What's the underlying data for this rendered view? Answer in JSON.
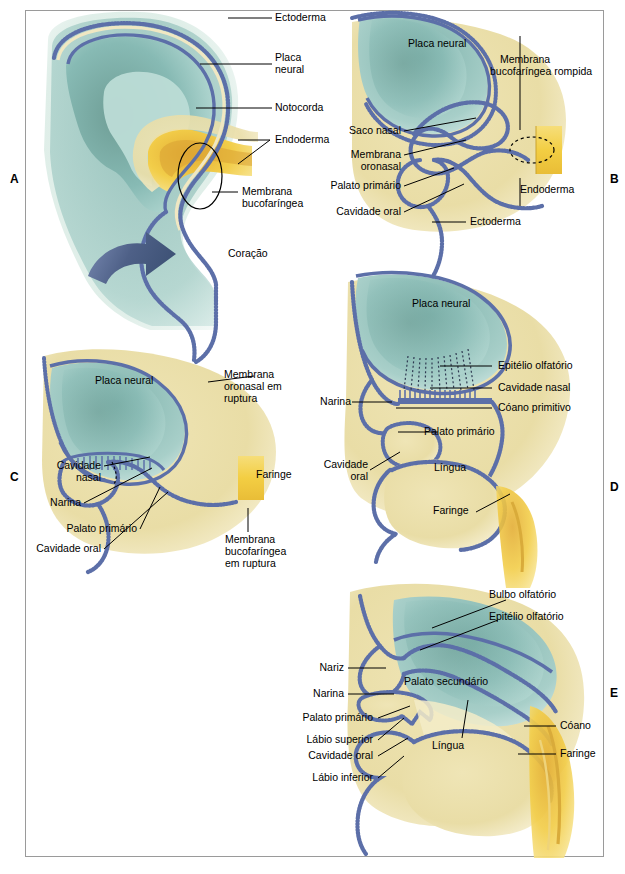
{
  "figure": {
    "language": "pt-BR",
    "panel_letters": [
      "A",
      "B",
      "C",
      "D",
      "E"
    ],
    "colors": {
      "ectoderm_border": "#5c6fa8",
      "neural_plate": "#8fc0bb",
      "neural_plate_deep": "#6f9e96",
      "mesenchyme": "#ece0ae",
      "endoderm": "#f2cd44",
      "endoderm_deep": "#e0a93a",
      "arrow": "#5a6b96",
      "frame_border": "#9a9a9a",
      "background": "#ffffff",
      "leader_line": "#000000"
    }
  },
  "panels": {
    "A": {
      "letter": "A",
      "labels": [
        {
          "text": "Ectoderma",
          "name": "label-ectoderma"
        },
        {
          "text": "Placa",
          "name": "label-placa-neural-line1"
        },
        {
          "text": "neural",
          "name": "label-placa-neural-line2"
        },
        {
          "text": "Notocorda",
          "name": "label-notocorda"
        },
        {
          "text": "Endoderma",
          "name": "label-endoderma"
        },
        {
          "text": "Membrana",
          "name": "label-membrana-bucofaringea-line1"
        },
        {
          "text": "bucofaríngea",
          "name": "label-membrana-bucofaringea-line2"
        },
        {
          "text": "Coração",
          "name": "label-coracao"
        }
      ]
    },
    "B": {
      "letter": "B",
      "labels": [
        {
          "text": "Placa neural",
          "name": "label-placa-neural"
        },
        {
          "text": "Membrana",
          "name": "label-membrana-bucofaringea-rompida-line1"
        },
        {
          "text": "bucofaríngea rompida",
          "name": "label-membrana-bucofaringea-rompida-line2"
        },
        {
          "text": "Saco nasal",
          "name": "label-saco-nasal"
        },
        {
          "text": "Membrana",
          "name": "label-membrana-oronasal-line1"
        },
        {
          "text": "oronasal",
          "name": "label-membrana-oronasal-line2"
        },
        {
          "text": "Palato primário",
          "name": "label-palato-primario"
        },
        {
          "text": "Cavidade oral",
          "name": "label-cavidade-oral"
        },
        {
          "text": "Ectoderma",
          "name": "label-ectoderma"
        },
        {
          "text": "Endoderma",
          "name": "label-endoderma"
        }
      ]
    },
    "C": {
      "letter": "C",
      "labels": [
        {
          "text": "Placa neural",
          "name": "label-placa-neural"
        },
        {
          "text": "Membrana",
          "name": "label-membrana-oronasal-ruptura-line1"
        },
        {
          "text": "oronasal em",
          "name": "label-membrana-oronasal-ruptura-line2"
        },
        {
          "text": "ruptura",
          "name": "label-membrana-oronasal-ruptura-line3"
        },
        {
          "text": "Cavidade",
          "name": "label-cavidade-nasal-line1"
        },
        {
          "text": "nasal",
          "name": "label-cavidade-nasal-line2"
        },
        {
          "text": "Narina",
          "name": "label-narina"
        },
        {
          "text": "Palato primário",
          "name": "label-palato-primario"
        },
        {
          "text": "Cavidade oral",
          "name": "label-cavidade-oral"
        },
        {
          "text": "Faringe",
          "name": "label-faringe"
        },
        {
          "text": "Membrana",
          "name": "label-membrana-bucofaringea-ruptura-line1"
        },
        {
          "text": "bucofaríngea",
          "name": "label-membrana-bucofaringea-ruptura-line2"
        },
        {
          "text": "em ruptura",
          "name": "label-membrana-bucofaringea-ruptura-line3"
        }
      ]
    },
    "D": {
      "letter": "D",
      "labels": [
        {
          "text": "Placa neural",
          "name": "label-placa-neural"
        },
        {
          "text": "Epitélio olfatório",
          "name": "label-epitelio-olfatorio"
        },
        {
          "text": "Cavidade nasal",
          "name": "label-cavidade-nasal"
        },
        {
          "text": "Cóano primitivo",
          "name": "label-coano-primitivo"
        },
        {
          "text": "Narina",
          "name": "label-narina"
        },
        {
          "text": "Palato primário",
          "name": "label-palato-primario"
        },
        {
          "text": "Cavidade",
          "name": "label-cavidade-oral-line1"
        },
        {
          "text": "oral",
          "name": "label-cavidade-oral-line2"
        },
        {
          "text": "Língua",
          "name": "label-lingua"
        },
        {
          "text": "Faringe",
          "name": "label-faringe"
        }
      ]
    },
    "E": {
      "letter": "E",
      "labels": [
        {
          "text": "Bulbo olfatório",
          "name": "label-bulbo-olfatorio"
        },
        {
          "text": "Epitélio olfatório",
          "name": "label-epitelio-olfatorio"
        },
        {
          "text": "Nariz",
          "name": "label-nariz"
        },
        {
          "text": "Narina",
          "name": "label-narina"
        },
        {
          "text": "Palato secundário",
          "name": "label-palato-secundario"
        },
        {
          "text": "Palato primário",
          "name": "label-palato-primario"
        },
        {
          "text": "Lábio superior",
          "name": "label-labio-superior"
        },
        {
          "text": "Cavidade oral",
          "name": "label-cavidade-oral"
        },
        {
          "text": "Lábio inferior",
          "name": "label-labio-inferior"
        },
        {
          "text": "Língua",
          "name": "label-lingua"
        },
        {
          "text": "Cóano",
          "name": "label-coano"
        },
        {
          "text": "Faringe",
          "name": "label-faringe"
        }
      ]
    }
  }
}
